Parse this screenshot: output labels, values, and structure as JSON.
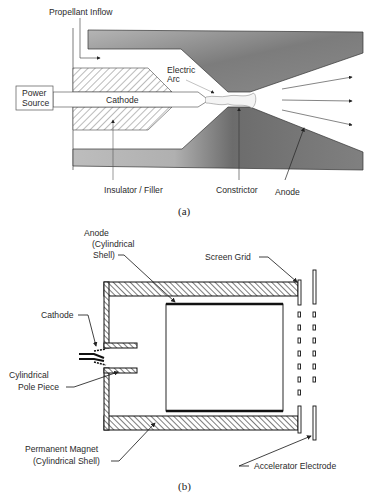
{
  "figure_a": {
    "caption": "(a)",
    "labels": {
      "propellant_inflow": "Propellant Inflow",
      "power_source_line1": "Power",
      "power_source_line2": "Source",
      "cathode": "Cathode",
      "electric_arc_line1": "Electric",
      "electric_arc_line2": "Arc",
      "insulator_filler": "Insulator / Filler",
      "constrictor": "Constrictor",
      "anode": "Anode"
    }
  },
  "figure_b": {
    "caption": "(b)",
    "labels": {
      "anode_line1": "Anode",
      "anode_line2": "(Cylindrical",
      "anode_line3": "Shell)",
      "screen_grid": "Screen Grid",
      "cathode": "Cathode",
      "pole_piece_line1": "Cylindrical",
      "pole_piece_line2": "Pole Piece",
      "magnet_line1": "Permanent Magnet",
      "magnet_line2": "(Cylindrical Shell)",
      "accelerator_electrode": "Accelerator Electrode"
    }
  },
  "colors": {
    "anode_fill_light": "#b8b8b8",
    "anode_fill_dark": "#6e6e6e",
    "line": "#333333"
  }
}
